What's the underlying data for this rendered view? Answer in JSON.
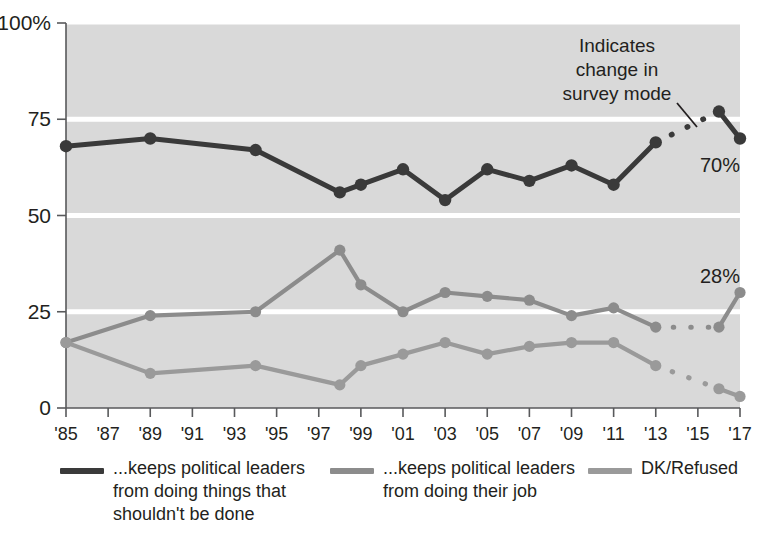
{
  "chart_data": {
    "type": "line",
    "title": "",
    "subtitle": "",
    "xlabel": "",
    "ylabel": "",
    "ylim": [
      0,
      100
    ],
    "yticks": [
      0,
      25,
      50,
      75,
      100
    ],
    "ytick_labels": [
      "0",
      "25",
      "50",
      "75",
      "100%"
    ],
    "xlim": [
      1985,
      2017
    ],
    "xticks": [
      1985,
      1987,
      1989,
      1991,
      1993,
      1995,
      1997,
      1999,
      2001,
      2003,
      2005,
      2007,
      2009,
      2011,
      2013,
      2015,
      2017
    ],
    "xtick_labels": [
      "'85",
      "'87",
      "'89",
      "'91",
      "'93",
      "'95",
      "'97",
      "'99",
      "'01",
      "'03",
      "'05",
      "'07",
      "'09",
      "'11",
      "'13",
      "'15",
      "'17"
    ],
    "grid": true,
    "grid_orientation": "horizontal",
    "legend_position": "bottom",
    "plot_bg": "#d9d9d9",
    "gridline_color": "#ffffff",
    "series": [
      {
        "name": "...keeps political leaders from doing things that shouldn't be done",
        "color": "#3a3a3a",
        "end_label": "70%",
        "points": [
          {
            "x": 1985,
            "y": 68
          },
          {
            "x": 1989,
            "y": 70
          },
          {
            "x": 1994,
            "y": 67
          },
          {
            "x": 1998,
            "y": 56
          },
          {
            "x": 1999,
            "y": 58
          },
          {
            "x": 2001,
            "y": 62
          },
          {
            "x": 2003,
            "y": 54
          },
          {
            "x": 2005,
            "y": 62
          },
          {
            "x": 2007,
            "y": 59
          },
          {
            "x": 2009,
            "y": 63
          },
          {
            "x": 2011,
            "y": 58
          },
          {
            "x": 2013,
            "y": 69
          },
          {
            "x": 2016,
            "y": 77
          },
          {
            "x": 2017,
            "y": 70
          }
        ],
        "dashed_between": [
          2013,
          2016
        ]
      },
      {
        "name": "...keeps political leaders from doing their job",
        "color": "#8c8c8c",
        "end_label": "28%",
        "points": [
          {
            "x": 1985,
            "y": 17
          },
          {
            "x": 1989,
            "y": 24
          },
          {
            "x": 1994,
            "y": 25
          },
          {
            "x": 1998,
            "y": 41
          },
          {
            "x": 1999,
            "y": 32
          },
          {
            "x": 2001,
            "y": 25
          },
          {
            "x": 2003,
            "y": 30
          },
          {
            "x": 2005,
            "y": 29
          },
          {
            "x": 2007,
            "y": 28
          },
          {
            "x": 2009,
            "y": 24
          },
          {
            "x": 2011,
            "y": 26
          },
          {
            "x": 2013,
            "y": 21
          },
          {
            "x": 2016,
            "y": 21
          },
          {
            "x": 2017,
            "y": 30
          }
        ],
        "dashed_between": [
          2013,
          2016
        ]
      },
      {
        "name": "DK/Refused",
        "color": "#9a9a9a",
        "end_label": "",
        "points": [
          {
            "x": 1985,
            "y": 17
          },
          {
            "x": 1989,
            "y": 9
          },
          {
            "x": 1994,
            "y": 11
          },
          {
            "x": 1998,
            "y": 6
          },
          {
            "x": 1999,
            "y": 11
          },
          {
            "x": 2001,
            "y": 14
          },
          {
            "x": 2003,
            "y": 17
          },
          {
            "x": 2005,
            "y": 14
          },
          {
            "x": 2007,
            "y": 16
          },
          {
            "x": 2009,
            "y": 17
          },
          {
            "x": 2011,
            "y": 17
          },
          {
            "x": 2013,
            "y": 11
          },
          {
            "x": 2016,
            "y": 5
          },
          {
            "x": 2017,
            "y": 3
          }
        ],
        "dashed_between": [
          2013,
          2016
        ]
      }
    ],
    "annotations": [
      {
        "name": "survey-mode-note",
        "lines": [
          "Indicates",
          "change in",
          "survey mode"
        ],
        "text": "Indicates change in survey mode"
      }
    ]
  },
  "legend": {
    "items": [
      {
        "label": "...keeps political leaders\nfrom doing things that\nshouldn't be done",
        "color": "#3a3a3a"
      },
      {
        "label": "...keeps political leaders\nfrom doing their job",
        "color": "#8c8c8c"
      },
      {
        "label": "DK/Refused",
        "color": "#9a9a9a"
      }
    ]
  }
}
